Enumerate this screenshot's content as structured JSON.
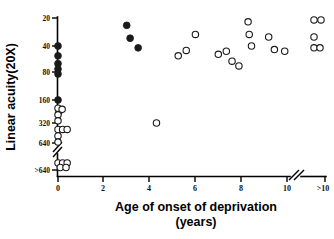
{
  "figure": {
    "width": 334,
    "height": 239,
    "background": "#ffffff",
    "ink_color": "#111111"
  },
  "chart_data": {
    "type": "scatter",
    "title": "",
    "xlabel": "Age of onset of deprivation",
    "xlabel_line2": "(years)",
    "ylabel": "Linear acuity(20X)",
    "xticks": [
      "0",
      "2",
      "4",
      "6",
      "8",
      "10",
      ">10"
    ],
    "xtick_values": [
      0,
      2,
      4,
      6,
      8,
      10,
      12
    ],
    "yticks": [
      "20",
      "40",
      "80",
      "160",
      "320",
      "640",
      ">640"
    ],
    "ytick_values": [
      20,
      40,
      80,
      160,
      320,
      640,
      1280
    ],
    "y_scale": "log-reversed",
    "y_axis_break_between": [
      "640",
      ">640"
    ],
    "x_axis_break_between": [
      "10",
      ">10"
    ],
    "grid": false,
    "legend_position": "none",
    "series": [
      {
        "name": "filled-circles",
        "marker": "filled circle",
        "color": "#1a1a1a",
        "points": [
          {
            "x": 0.0,
            "y": 40
          },
          {
            "x": 0.0,
            "y": 52
          },
          {
            "x": 0.0,
            "y": 64
          },
          {
            "x": 0.0,
            "y": 74
          },
          {
            "x": 0.0,
            "y": 84
          },
          {
            "x": 0.0,
            "y": 160
          },
          {
            "x": 0.05,
            "y": 225
          },
          {
            "x": 3.0,
            "y": 24
          },
          {
            "x": 3.15,
            "y": 33
          },
          {
            "x": 3.5,
            "y": 42
          }
        ]
      },
      {
        "name": "open-circles",
        "marker": "open circle",
        "color": "#1a1a1a",
        "points": [
          {
            "x": 0.0,
            "y": 205
          },
          {
            "x": 0.18,
            "y": 212
          },
          {
            "x": 0.0,
            "y": 250
          },
          {
            "x": 0.0,
            "y": 300
          },
          {
            "x": 0.0,
            "y": 400
          },
          {
            "x": 0.2,
            "y": 400
          },
          {
            "x": 0.4,
            "y": 400
          },
          {
            "x": 0.0,
            "y": 500
          },
          {
            "x": 0.0,
            "y": 620
          },
          {
            "x": 0.0,
            "y": 1200
          },
          {
            "x": 0.2,
            "y": 1200
          },
          {
            "x": 0.4,
            "y": 1200
          },
          {
            "x": 0.1,
            "y": 1400
          },
          {
            "x": 0.35,
            "y": 1400
          },
          {
            "x": 4.3,
            "y": 320
          },
          {
            "x": 6.0,
            "y": 30
          },
          {
            "x": 5.6,
            "y": 45
          },
          {
            "x": 5.25,
            "y": 52
          },
          {
            "x": 7.0,
            "y": 50
          },
          {
            "x": 7.35,
            "y": 46
          },
          {
            "x": 7.6,
            "y": 60
          },
          {
            "x": 7.9,
            "y": 68
          },
          {
            "x": 8.3,
            "y": 22
          },
          {
            "x": 8.35,
            "y": 30
          },
          {
            "x": 8.45,
            "y": 40
          },
          {
            "x": 9.2,
            "y": 32
          },
          {
            "x": 9.45,
            "y": 44
          },
          {
            "x": 9.9,
            "y": 46
          },
          {
            "x": 12.0,
            "y": 21
          },
          {
            "x": 12.35,
            "y": 21
          },
          {
            "x": 12.0,
            "y": 32
          },
          {
            "x": 12.0,
            "y": 42
          },
          {
            "x": 12.3,
            "y": 42
          }
        ]
      }
    ]
  }
}
